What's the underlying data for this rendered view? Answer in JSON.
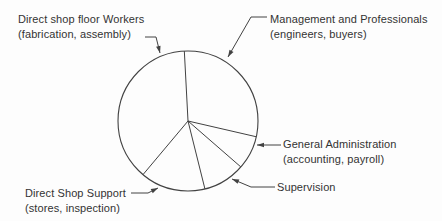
{
  "chart_data": {
    "type": "pie",
    "style": "outline-only monochrome pie with external arrow-annotated labels",
    "angle_convention": "degrees clockwise from 12 o'clock",
    "slices": [
      {
        "label": "Management and Professionals",
        "sublabel": "(engineers, buyers)",
        "start_angle_deg": 357,
        "end_angle_deg": 103,
        "span_deg": 106,
        "percent_est": 29.4
      },
      {
        "label": "General Administration",
        "sublabel": "(accounting, payroll)",
        "start_angle_deg": 103,
        "end_angle_deg": 131,
        "span_deg": 28,
        "percent_est": 7.8
      },
      {
        "label": "Supervision",
        "sublabel": "",
        "start_angle_deg": 131,
        "end_angle_deg": 166,
        "span_deg": 35,
        "percent_est": 9.7
      },
      {
        "label": "Direct Shop Support",
        "sublabel": "(stores, inspection)",
        "start_angle_deg": 166,
        "end_angle_deg": 220,
        "span_deg": 54,
        "percent_est": 15.0
      },
      {
        "label": "Direct shop floor Workers",
        "sublabel": "(fabrication, assembly)",
        "start_angle_deg": 220,
        "end_angle_deg": 357,
        "span_deg": 137,
        "percent_est": 38.1
      }
    ],
    "legend_position": "external callouts with leader arrows",
    "grid": false,
    "title": ""
  },
  "labels": {
    "workers": {
      "line1": "Direct shop floor Workers",
      "line2": "(fabrication, assembly)"
    },
    "management": {
      "line1": "Management and Professionals",
      "line2": "(engineers, buyers)"
    },
    "general_admin": {
      "line1": "General Administration",
      "line2": "(accounting, payroll)"
    },
    "supervision": {
      "line1": "Supervision"
    },
    "shop_support": {
      "line1": "Direct Shop Support",
      "line2": "(stores, inspection)"
    }
  },
  "colors": {
    "line": "#424242",
    "text": "#333333",
    "background": "#fdfdfd",
    "slice_fill": "#fdfdfd"
  }
}
